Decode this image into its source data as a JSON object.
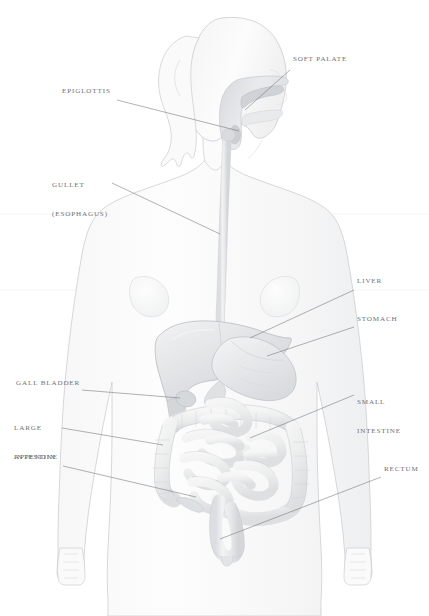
{
  "figure": {
    "background_color": "#ffffff",
    "body_fill": "#fbfbfb",
    "body_stroke": "#c9cbcf",
    "organ_fill_light": "#f2f2f3",
    "organ_fill_mid": "#e4e5e7",
    "organ_fill_dark": "#d2d4d7",
    "leader_line_color": "#6f7176",
    "label_text_color": "#6e7076"
  },
  "labels": [
    {
      "id": "soft-palate",
      "text": "SOFT PALATE",
      "side": "right",
      "lines": [
        "SOFT PALATE"
      ],
      "text_x": 293,
      "text_y": 61,
      "leader": {
        "x1": 290,
        "y1": 70,
        "x2": 245,
        "y2": 110
      }
    },
    {
      "id": "epiglottis",
      "text": "EPIGLOTTIS",
      "side": "left",
      "lines": [
        "EPIGLOTTIS"
      ],
      "text_x": 62,
      "text_y": 93,
      "leader": {
        "x1": 117,
        "y1": 100,
        "x2": 239,
        "y2": 131
      }
    },
    {
      "id": "gullet-esophagus",
      "text": "GULLET (ESOPHAGUS)",
      "side": "left",
      "lines": [
        "GULLET",
        "(ESOPHAGUS)"
      ],
      "text_x": 52,
      "text_y": 167,
      "leader": {
        "x1": 112,
        "y1": 183,
        "x2": 220,
        "y2": 234
      }
    },
    {
      "id": "liver",
      "text": "LIVER",
      "side": "right",
      "lines": [
        "LIVER"
      ],
      "text_x": 357,
      "text_y": 283,
      "leader": {
        "x1": 354,
        "y1": 290,
        "x2": 250,
        "y2": 338
      }
    },
    {
      "id": "stomach",
      "text": "STOMACH",
      "side": "right",
      "lines": [
        "STOMACH"
      ],
      "text_x": 357,
      "text_y": 321,
      "leader": {
        "x1": 354,
        "y1": 327,
        "x2": 267,
        "y2": 356
      }
    },
    {
      "id": "gall-bladder",
      "text": "GALL BLADDER",
      "side": "left",
      "lines": [
        "GALL BLADDER"
      ],
      "text_x": 16,
      "text_y": 385,
      "leader": {
        "x1": 82,
        "y1": 390,
        "x2": 180,
        "y2": 398
      }
    },
    {
      "id": "small-intestine",
      "text": "SMALL INTESTINE",
      "side": "right",
      "lines": [
        "SMALL",
        "INTESTINE"
      ],
      "text_x": 357,
      "text_y": 384,
      "leader": {
        "x1": 354,
        "y1": 395,
        "x2": 250,
        "y2": 438
      }
    },
    {
      "id": "large-intestine",
      "text": "LARGE INTESTINE",
      "side": "left",
      "lines": [
        "LARGE",
        "INTESTINE"
      ],
      "text_x": 14,
      "text_y": 410,
      "leader": {
        "x1": 62,
        "y1": 428,
        "x2": 163,
        "y2": 445
      }
    },
    {
      "id": "appendix",
      "text": "APPENDIX",
      "side": "left",
      "lines": [
        "APPENDIX"
      ],
      "text_x": 14,
      "text_y": 459,
      "leader": {
        "x1": 63,
        "y1": 466,
        "x2": 196,
        "y2": 497
      }
    },
    {
      "id": "rectum",
      "text": "RECTUM",
      "side": "right",
      "lines": [
        "RECTUM"
      ],
      "text_x": 384,
      "text_y": 471,
      "leader": {
        "x1": 381,
        "y1": 477,
        "x2": 220,
        "y2": 539
      }
    }
  ],
  "organs": [
    {
      "id": "soft-palate",
      "name": "soft palate"
    },
    {
      "id": "epiglottis",
      "name": "epiglottis"
    },
    {
      "id": "esophagus",
      "name": "gullet (esophagus)"
    },
    {
      "id": "liver",
      "name": "liver"
    },
    {
      "id": "stomach",
      "name": "stomach"
    },
    {
      "id": "gall-bladder",
      "name": "gall bladder"
    },
    {
      "id": "small-intestine",
      "name": "small intestine"
    },
    {
      "id": "large-intestine",
      "name": "large intestine"
    },
    {
      "id": "appendix",
      "name": "appendix"
    },
    {
      "id": "rectum",
      "name": "rectum"
    }
  ]
}
